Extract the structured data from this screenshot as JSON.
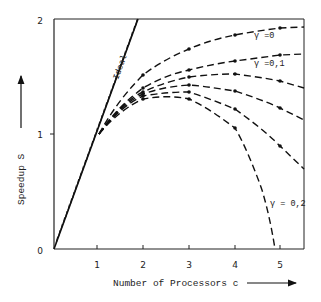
{
  "chart_data": {
    "type": "line",
    "title": "",
    "xlabel": "Number of Processors c",
    "ylabel": "Speedup S",
    "xlim": [
      0,
      5.5
    ],
    "ylim": [
      0,
      2
    ],
    "x_ticks": [
      "1",
      "2",
      "3",
      "4",
      "5"
    ],
    "y_ticks": [
      "0",
      "1",
      "2"
    ],
    "grid": false,
    "legend": "inline labels on curves",
    "series": [
      {
        "name": "Ideal",
        "style": "hatched-solid",
        "x": [
          0,
          1,
          2
        ],
        "values": [
          0,
          1,
          2
        ]
      },
      {
        "name": "γ = 0",
        "style": "dashed",
        "x": [
          1,
          2,
          3,
          4,
          5,
          5.5
        ],
        "values": [
          1.0,
          1.51,
          1.74,
          1.86,
          1.92,
          1.93
        ]
      },
      {
        "name": "γ = 0,1",
        "style": "dashed",
        "x": [
          1,
          2,
          3,
          4,
          5,
          5.5
        ],
        "values": [
          1.0,
          1.4,
          1.56,
          1.63,
          1.69,
          1.7
        ]
      },
      {
        "name": "",
        "style": "dashed",
        "x": [
          1,
          2,
          3,
          4,
          5,
          5.5
        ],
        "values": [
          1.0,
          1.37,
          1.5,
          1.52,
          1.46,
          1.4
        ]
      },
      {
        "name": "",
        "style": "dashed",
        "x": [
          1,
          2,
          3,
          4,
          5,
          5.5
        ],
        "values": [
          1.0,
          1.35,
          1.43,
          1.37,
          1.23,
          1.12
        ]
      },
      {
        "name": "",
        "style": "dashed",
        "x": [
          1,
          2,
          3,
          4,
          5,
          5.5
        ],
        "values": [
          1.0,
          1.33,
          1.37,
          1.21,
          0.9,
          0.7
        ]
      },
      {
        "name": "γ = 0,2",
        "style": "dashed",
        "x": [
          1,
          2,
          3,
          4,
          4.5,
          4.9
        ],
        "values": [
          1.0,
          1.3,
          1.3,
          1.05,
          0.62,
          0.0
        ]
      }
    ],
    "annotations": [
      "Ideal",
      "γ = 0",
      "γ = 0,1",
      "γ = 0,2"
    ]
  },
  "labels": {
    "ideal": "Ideal",
    "g0": "γ =0",
    "g01": "γ =0,1",
    "g02": "γ = 0,2",
    "xlabel": "Number of Processors c",
    "ylabel": "Speedup S",
    "xt1": "1",
    "xt2": "2",
    "xt3": "3",
    "xt4": "4",
    "xt5": "5",
    "yt0": "0",
    "yt1": "1",
    "yt2": "2"
  }
}
